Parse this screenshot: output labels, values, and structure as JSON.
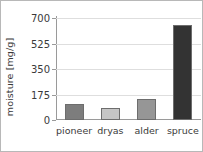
{
  "chart_data": {
    "type": "bar",
    "title": "",
    "xlabel": "",
    "ylabel": "moisture [mg/g]",
    "categories": [
      "pioneer",
      "dryas",
      "alder",
      "spruce"
    ],
    "values": [
      110,
      82,
      144,
      652
    ],
    "bar_colors": [
      "#7d7d7d",
      "#c5c5c5",
      "#969696",
      "#333333"
    ],
    "bar_edge_color": "#6d6d6d",
    "ylim": [
      0,
      700
    ],
    "yticks": [
      0,
      175,
      350,
      525,
      700
    ],
    "ytick_labels": [
      "0",
      "175",
      "350",
      "525",
      "700"
    ],
    "grid": true,
    "grid_axis": "y",
    "grid_color": "#dedede",
    "legend": null,
    "legend_position": "none",
    "axis_color": "#9a9a9a",
    "text_color": "#3a3a3a",
    "background": "#ffffff",
    "border_color": "#b8b8b8"
  }
}
